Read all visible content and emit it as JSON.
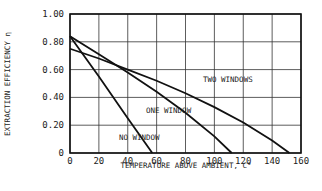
{
  "chart_data": {
    "type": "line",
    "title": "",
    "xlabel": "TEMPERATURE ABOVE AMBIENT, C°",
    "ylabel": "EXTRACTION EFFICIENCY η",
    "xlim": [
      0,
      160
    ],
    "ylim": [
      0,
      1.0
    ],
    "grid": true,
    "x_ticks": [
      "0",
      "20",
      "40",
      "60",
      "80",
      "100",
      "120",
      "140",
      "160"
    ],
    "y_ticks": [
      "0",
      "0.20",
      "0.40",
      "0.60",
      "0.80",
      "1.00"
    ],
    "series": [
      {
        "name": "NO WINDOW",
        "x": [
          0,
          20,
          40,
          57
        ],
        "y": [
          0.84,
          0.55,
          0.25,
          0.0
        ]
      },
      {
        "name": "ONE WINDOW",
        "x": [
          0,
          20,
          40,
          60,
          80,
          100,
          112
        ],
        "y": [
          0.84,
          0.71,
          0.58,
          0.44,
          0.29,
          0.12,
          0.0
        ]
      },
      {
        "name": "TWO WINDOWS",
        "x": [
          0,
          20,
          40,
          60,
          80,
          100,
          120,
          140,
          152
        ],
        "y": [
          0.75,
          0.68,
          0.6,
          0.52,
          0.43,
          0.33,
          0.22,
          0.09,
          0.0
        ]
      }
    ],
    "annotations": [
      "TWO WINDOWS",
      "ONE WINDOW",
      "NO WINDOW"
    ]
  }
}
